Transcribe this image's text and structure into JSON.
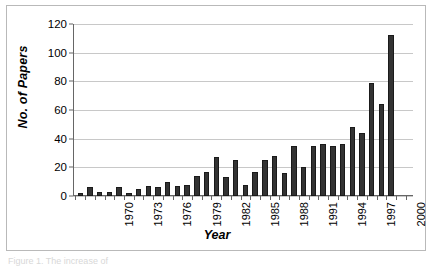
{
  "figure": {
    "caption": "Figure 1.  The increase of"
  },
  "chart_data": {
    "type": "bar",
    "title": "",
    "xlabel": "Year",
    "ylabel": "No. of Papers",
    "ylim": [
      0,
      120
    ],
    "yticks": [
      0,
      20,
      40,
      60,
      80,
      100,
      120
    ],
    "grid": true,
    "legend": "none",
    "bar_color": "#333333",
    "gridline_color": "#c8c8c8",
    "axis_color": "#666666",
    "categories": [
      "1966",
      "1967",
      "1968",
      "1969",
      "1970",
      "1971",
      "1972",
      "1973",
      "1974",
      "1975",
      "1976",
      "1977",
      "1978",
      "1979",
      "1980",
      "1981",
      "1982",
      "1983",
      "1984",
      "1985",
      "1986",
      "1987",
      "1988",
      "1989",
      "1990",
      "1991",
      "1992",
      "1993",
      "1994",
      "1995",
      "1996",
      "1997",
      "1998",
      "1999"
    ],
    "values": [
      2,
      6,
      3,
      3,
      6,
      2,
      5,
      7,
      6,
      10,
      7,
      8,
      14,
      17,
      27,
      13,
      25,
      8,
      17,
      25,
      28,
      16,
      35,
      20,
      35,
      36,
      35,
      36,
      48,
      44,
      79,
      64,
      112,
      0
    ],
    "visible_xtick_labels": [
      "1970",
      "1973",
      "1976",
      "1979",
      "1982",
      "1985",
      "1988",
      "1991",
      "1994",
      "1997",
      "2000"
    ],
    "xtick_label_categories": [
      "1970",
      "1973",
      "1976",
      "1979",
      "1982",
      "1985",
      "1988",
      "1991",
      "1994",
      "1997",
      "2000"
    ],
    "xtick_label_rotation": -90
  }
}
